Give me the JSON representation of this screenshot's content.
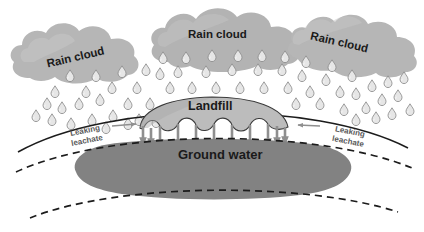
{
  "diagram": {
    "labels": {
      "cloud_left": "Rain cloud",
      "cloud_mid": "Rain cloud",
      "cloud_right": "Rain cloud",
      "landfill": "Landfill",
      "ground_water": "Ground water",
      "leachate_left": "Leaking\nleachate",
      "leachate_left_line1": "Leaking",
      "leachate_left_line2": "leachate",
      "leachate_right_line1": "Leaking",
      "leachate_right_line2": "leachate"
    },
    "colors": {
      "cloud_fill": "#b3b3b3",
      "cloud_fill_light": "#c9c9c9",
      "landfill_fill": "#b8b8b8",
      "ground_water_fill": "#828282",
      "soil_line": "#1a1a1a",
      "raindrop_fill": "#e3e3e3",
      "raindrop_stroke": "#8a8a8a",
      "arrow_gray": "#8f8f8f",
      "text_dark": "#1a1a1a",
      "text_gray": "#5a5a5a",
      "background": "#ffffff"
    },
    "elements": [
      {
        "name": "rain-cloud-left",
        "kind": "cloud"
      },
      {
        "name": "rain-cloud-middle",
        "kind": "cloud"
      },
      {
        "name": "rain-cloud-right",
        "kind": "cloud"
      },
      {
        "name": "rainfall",
        "kind": "raindrops",
        "count": 62
      },
      {
        "name": "ground-surface",
        "kind": "arc-line"
      },
      {
        "name": "landfill-mound",
        "kind": "filled-shape"
      },
      {
        "name": "leachate-arrows",
        "kind": "down-arrows",
        "count": 11
      },
      {
        "name": "ground-water-body",
        "kind": "filled-shape"
      },
      {
        "name": "aquifer-boundary-upper",
        "kind": "dashed-arc"
      },
      {
        "name": "aquifer-boundary-lower",
        "kind": "dashed-arc"
      },
      {
        "name": "leachate-pointer-left",
        "kind": "arrow-right"
      },
      {
        "name": "leachate-pointer-right",
        "kind": "arrow-left"
      }
    ]
  }
}
